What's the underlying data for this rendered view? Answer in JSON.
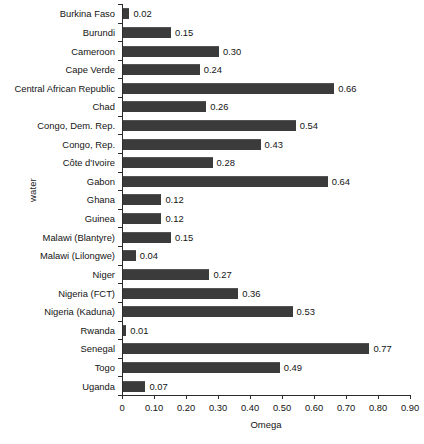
{
  "chart_data": {
    "type": "bar",
    "orientation": "horizontal",
    "title": "",
    "xlabel": "Omega",
    "ylabel": "water",
    "xlim": [
      0,
      0.9
    ],
    "xticks": [
      0,
      0.1,
      0.2,
      0.3,
      0.4,
      0.5,
      0.6,
      0.7,
      0.8,
      0.9
    ],
    "xtick_labels": [
      "0",
      "0.10",
      "0.20",
      "0.30",
      "0.40",
      "0.50",
      "0.60",
      "0.70",
      "0.80",
      "0.90"
    ],
    "grid": false,
    "legend": false,
    "bar_color": "#3b3b3b",
    "categories": [
      "Burkina Faso",
      "Burundi",
      "Cameroon",
      "Cape Verde",
      "Central African Republic",
      "Chad",
      "Congo, Dem. Rep.",
      "Congo, Rep.",
      "Côte d'Ivoire",
      "Gabon",
      "Ghana",
      "Guinea",
      "Malawi (Blantyre)",
      "Malawi (Lilongwe)",
      "Niger",
      "Nigeria  (FCT)",
      "Nigeria (Kaduna)",
      "Rwanda",
      "Senegal",
      "Togo",
      "Uganda"
    ],
    "values": [
      0.02,
      0.15,
      0.3,
      0.24,
      0.66,
      0.26,
      0.54,
      0.43,
      0.28,
      0.64,
      0.12,
      0.12,
      0.15,
      0.04,
      0.27,
      0.36,
      0.53,
      0.01,
      0.77,
      0.49,
      0.07
    ],
    "value_labels": [
      "0.02",
      "0.15",
      "0.30",
      "0.24",
      "0.66",
      "0.26",
      "0.54",
      "0.43",
      "0.28",
      "0.64",
      "0.12",
      "0.12",
      "0.15",
      "0.04",
      "0.27",
      "0.36",
      "0.53",
      "0.01",
      "0.77",
      "0.49",
      "0.07"
    ]
  }
}
